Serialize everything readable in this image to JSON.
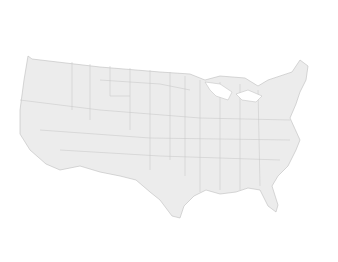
{
  "map": {
    "title_line1": "Information sector",
    "title_line2": "urban regions",
    "legend": {
      "title": "Rank",
      "items": [
        {
          "label": "Top 5",
          "marker": "large-dot"
        },
        {
          "label": "6–15",
          "marker": "small-dot"
        }
      ]
    },
    "cities": [
      {
        "name": "Seattle",
        "rank": "Top 5"
      },
      {
        "name": "San Jose",
        "rank": "Top 5"
      },
      {
        "name": "San Francisco",
        "rank": "Top 5"
      },
      {
        "name": "Los Angeles",
        "rank": "Top 5"
      },
      {
        "name": "Madison",
        "rank": "Top 5"
      },
      {
        "name": "Salt Lake City",
        "rank": "6–15"
      },
      {
        "name": "Provo",
        "rank": "6–15"
      },
      {
        "name": "Denver",
        "rank": "6–15"
      },
      {
        "name": "Des Moines",
        "rank": "6–15"
      },
      {
        "name": "Boston",
        "rank": "6–15"
      },
      {
        "name": "Washington, DC",
        "rank": "6–15"
      },
      {
        "name": "Raleigh",
        "rank": "6–15"
      },
      {
        "name": "Little Rock",
        "rank": "6–15"
      },
      {
        "name": "Atlanta",
        "rank": "6–15"
      },
      {
        "name": "Austin",
        "rank": "6–15"
      }
    ]
  }
}
